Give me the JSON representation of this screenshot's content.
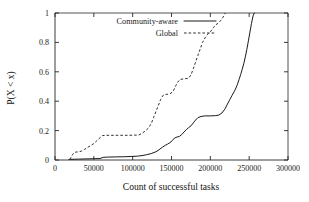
{
  "chart_data": {
    "type": "line",
    "title": "",
    "subtitle": "",
    "xlabel": "Count of successful tasks",
    "ylabel": "P(X < x)",
    "xlim": [
      0,
      300000
    ],
    "ylim": [
      0,
      1
    ],
    "grid": false,
    "legend_position": "top-left-inside",
    "xticks": [
      0,
      50000,
      100000,
      150000,
      200000,
      250000,
      300000
    ],
    "xticklabels": [
      "0",
      "50000",
      "100000",
      "150000",
      "200000",
      "250000",
      "300000"
    ],
    "yticks": [
      0,
      0.2,
      0.4,
      0.6,
      0.8,
      1
    ],
    "yticklabels": [
      "0",
      "0.2",
      "0.4",
      "0.6",
      "0.8",
      "1"
    ],
    "series": [
      {
        "name": "Community-aware",
        "style": "solid",
        "color": "#1a1a1a",
        "points": [
          [
            18000,
            0.004
          ],
          [
            30000,
            0.006
          ],
          [
            45000,
            0.008
          ],
          [
            58000,
            0.01
          ],
          [
            62000,
            0.018
          ],
          [
            68000,
            0.02
          ],
          [
            78000,
            0.021
          ],
          [
            88000,
            0.022
          ],
          [
            98000,
            0.024
          ],
          [
            106000,
            0.026
          ],
          [
            112000,
            0.03
          ],
          [
            118000,
            0.036
          ],
          [
            124000,
            0.044
          ],
          [
            130000,
            0.056
          ],
          [
            134000,
            0.07
          ],
          [
            138000,
            0.086
          ],
          [
            142000,
            0.1
          ],
          [
            145000,
            0.108
          ],
          [
            148000,
            0.118
          ],
          [
            151000,
            0.132
          ],
          [
            154000,
            0.15
          ],
          [
            157000,
            0.156
          ],
          [
            160000,
            0.16
          ],
          [
            163000,
            0.172
          ],
          [
            166000,
            0.19
          ],
          [
            169000,
            0.206
          ],
          [
            172000,
            0.22
          ],
          [
            175000,
            0.232
          ],
          [
            178000,
            0.252
          ],
          [
            181000,
            0.272
          ],
          [
            184000,
            0.288
          ],
          [
            188000,
            0.296
          ],
          [
            193000,
            0.3
          ],
          [
            200000,
            0.3
          ],
          [
            207000,
            0.302
          ],
          [
            211000,
            0.306
          ],
          [
            215000,
            0.32
          ],
          [
            219000,
            0.348
          ],
          [
            222000,
            0.38
          ],
          [
            225000,
            0.41
          ],
          [
            228000,
            0.44
          ],
          [
            231000,
            0.468
          ],
          [
            233000,
            0.49
          ],
          [
            235000,
            0.516
          ],
          [
            237000,
            0.548
          ],
          [
            239000,
            0.58
          ],
          [
            241000,
            0.616
          ],
          [
            243000,
            0.654
          ],
          [
            245000,
            0.7
          ],
          [
            247000,
            0.752
          ],
          [
            249000,
            0.81
          ],
          [
            251000,
            0.87
          ],
          [
            253000,
            0.93
          ],
          [
            255000,
            0.98
          ],
          [
            256500,
            1.0
          ]
        ]
      },
      {
        "name": "Global",
        "style": "dashed",
        "color": "#303030",
        "points": [
          [
            19000,
            0.004
          ],
          [
            21000,
            0.02
          ],
          [
            23000,
            0.04
          ],
          [
            25000,
            0.052
          ],
          [
            30000,
            0.056
          ],
          [
            34000,
            0.06
          ],
          [
            38000,
            0.072
          ],
          [
            42000,
            0.086
          ],
          [
            46000,
            0.098
          ],
          [
            50000,
            0.112
          ],
          [
            54000,
            0.132
          ],
          [
            58000,
            0.152
          ],
          [
            61000,
            0.166
          ],
          [
            66000,
            0.168
          ],
          [
            80000,
            0.168
          ],
          [
            95000,
            0.168
          ],
          [
            108000,
            0.17
          ],
          [
            112000,
            0.182
          ],
          [
            116000,
            0.196
          ],
          [
            120000,
            0.216
          ],
          [
            124000,
            0.248
          ],
          [
            127000,
            0.29
          ],
          [
            130000,
            0.33
          ],
          [
            133000,
            0.37
          ],
          [
            136000,
            0.412
          ],
          [
            139000,
            0.44
          ],
          [
            143000,
            0.446
          ],
          [
            148000,
            0.45
          ],
          [
            152000,
            0.466
          ],
          [
            155000,
            0.5
          ],
          [
            158000,
            0.53
          ],
          [
            161000,
            0.548
          ],
          [
            166000,
            0.552
          ],
          [
            172000,
            0.556
          ],
          [
            175000,
            0.578
          ],
          [
            178000,
            0.62
          ],
          [
            181000,
            0.666
          ],
          [
            184000,
            0.712
          ],
          [
            187000,
            0.756
          ],
          [
            190000,
            0.8
          ],
          [
            193000,
            0.83
          ],
          [
            196000,
            0.852
          ],
          [
            200000,
            0.872
          ],
          [
            204000,
            0.9
          ],
          [
            207000,
            0.92
          ],
          [
            210000,
            0.93
          ],
          [
            213000,
            0.946
          ],
          [
            216000,
            0.968
          ],
          [
            218000,
            0.99
          ],
          [
            219500,
            1.0
          ]
        ]
      }
    ]
  }
}
